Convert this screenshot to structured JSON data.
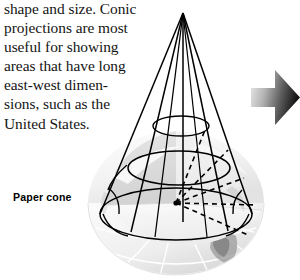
{
  "figure": {
    "caption_text": "shape and size. Conic\nprojections are most\nuseful for showing\nareas that have long\neast-west dimen-\nsions, such as the\nUnited States.",
    "paper_cone_label": "Paper cone",
    "arrow_icon_name": "right-arrow-icon",
    "colors": {
      "background": "#ffffff",
      "text": "#141414",
      "line": "#000000",
      "globe_light": "#f3f3f3",
      "globe_mid": "#dcdcdc",
      "globe_shade": "#c9c9c9",
      "cut_face": "#d6d6d6",
      "cut_face_light": "#efefef",
      "arrow_light": "#e8e8e8",
      "arrow_dark": "#1c1c1c"
    },
    "diagram": {
      "type": "conic-projection-illustration",
      "cone": {
        "apex": {
          "x": 183,
          "y": 13
        },
        "base_left": {
          "x": 100,
          "y": 214
        },
        "base_right": {
          "x": 252,
          "y": 214
        },
        "meridian_count": 5,
        "parallel_count": 3
      },
      "globe": {
        "center": {
          "x": 176,
          "y": 203
        },
        "radius_x": 88,
        "radius_y": 72,
        "cutaway": true,
        "grid": "graticule"
      },
      "projection_rays": {
        "origin": {
          "x": 176,
          "y": 203
        },
        "style": "dashed",
        "count": 5
      }
    }
  }
}
